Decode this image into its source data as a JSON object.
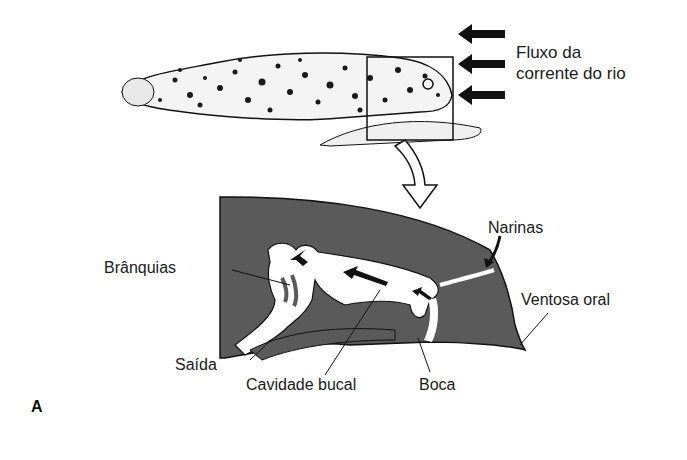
{
  "figure": {
    "panel_label": "A",
    "colors": {
      "tissue": "#5a5a5a",
      "outline": "#111111",
      "background": "#ffffff"
    },
    "top_view": {
      "flow_label_line1": "Fluxo da",
      "flow_label_line2": "corrente do rio",
      "flow_arrows": 3,
      "icon": "left-arrow-icon"
    },
    "section_view": {
      "labels": {
        "gills": "Brânquias",
        "nostrils": "Narinas",
        "oral_sucker": "Ventosa oral",
        "exit": "Saída",
        "buccal_cavity": "Cavidade bucal",
        "mouth": "Boca"
      }
    }
  }
}
